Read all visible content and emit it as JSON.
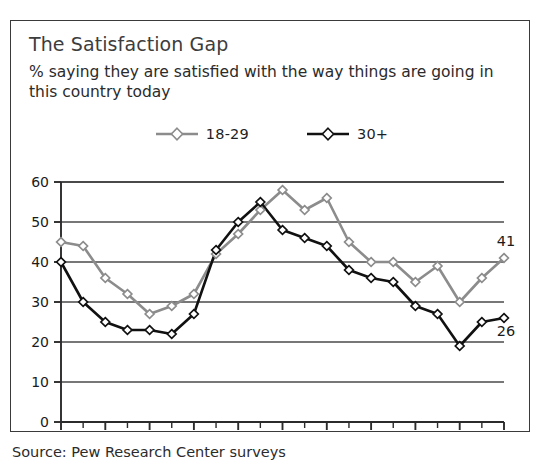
{
  "card": {
    "title": "The Satisfaction Gap",
    "subtitle": "% saying they are satisfied with the way things are going in this country today",
    "source": "Source: Pew Research Center surveys"
  },
  "legend": {
    "position": "top-center",
    "entries": [
      {
        "label": "18-29",
        "color": "#8c8c8c"
      },
      {
        "label": "30+",
        "color": "#111111"
      }
    ]
  },
  "colors": {
    "series_young": "#8c8c8c",
    "series_older": "#111111",
    "axis": "#2b2b2b",
    "grid": "#4a4a4a",
    "border": "#3a3a3a",
    "text": "#2b2b2b",
    "title_text": "#3d3d3d",
    "background": "#ffffff"
  },
  "chart_data": {
    "type": "line",
    "title": "The Satisfaction Gap",
    "subtitle": "% saying they are satisfied with the way things are going in this country today",
    "xlabel": "",
    "ylabel": "",
    "xlim": [
      1990,
      2010
    ],
    "ylim": [
      0,
      60
    ],
    "yticks": [
      0,
      10,
      20,
      30,
      40,
      50,
      60
    ],
    "ytick_labels": [
      "0",
      "10",
      "20",
      "30",
      "40",
      "50",
      "60"
    ],
    "xticks": [
      1990,
      1991,
      1992,
      1993,
      1994,
      1995,
      1996,
      1997,
      1998,
      1999,
      2000,
      2001,
      2002,
      2003,
      2004,
      2005,
      2006,
      2007,
      2008,
      2009,
      2010
    ],
    "xtick_labels_shown": [
      "1990",
      "1992",
      "1994",
      "1996",
      "1998",
      "2000",
      "2002",
      "2004",
      "2006",
      "2008",
      "2010"
    ],
    "grid": "horizontal",
    "legend_position": "top-center",
    "x": [
      1990,
      1991,
      1992,
      1993,
      1994,
      1995,
      1996,
      1997,
      1998,
      1999,
      2000,
      2001,
      2002,
      2003,
      2004,
      2005,
      2006,
      2007,
      2008,
      2009,
      2010
    ],
    "series": [
      {
        "name": "18-29",
        "color": "#8c8c8c",
        "marker": "diamond",
        "values": [
          45,
          44,
          36,
          32,
          27,
          29,
          32,
          42,
          47,
          53,
          58,
          53,
          56,
          45,
          40,
          40,
          35,
          39,
          30,
          36,
          41
        ],
        "end_label": "41"
      },
      {
        "name": "30+",
        "color": "#111111",
        "marker": "diamond",
        "values": [
          40,
          30,
          25,
          23,
          23,
          22,
          27,
          43,
          50,
          55,
          48,
          46,
          44,
          38,
          36,
          35,
          29,
          27,
          19,
          25,
          26
        ],
        "end_label": "26"
      }
    ],
    "annotations": [
      {
        "text": "41",
        "series": "18-29",
        "x": 2010,
        "y": 41
      },
      {
        "text": "26",
        "series": "30+",
        "x": 2010,
        "y": 26
      }
    ]
  }
}
